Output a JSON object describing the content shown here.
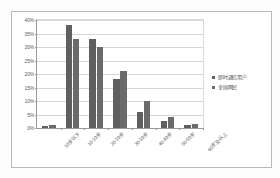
{
  "chart_data": {
    "type": "bar",
    "title": "",
    "subtitle": "",
    "xlabel": "",
    "ylabel": "",
    "ylim": [
      0,
      40
    ],
    "ytick_labels": [
      "0%",
      "5%",
      "10%",
      "15%",
      "20%",
      "25%",
      "30%",
      "35%",
      "40%"
    ],
    "ytick_values": [
      0,
      5,
      10,
      15,
      20,
      25,
      30,
      35,
      40
    ],
    "grid": true,
    "legend_position": "right",
    "categories": [
      "10岁以下",
      "10-19岁",
      "20-29岁",
      "30-39岁",
      "40-49岁",
      "50-59岁",
      "60岁及以上"
    ],
    "series": [
      {
        "name": "即时通信用户",
        "color": "#5f5f5f",
        "values": [
          0.8,
          38.0,
          33.0,
          18.0,
          6.0,
          2.5,
          1.0
        ]
      },
      {
        "name": "全国网民",
        "color": "#6a6a6a",
        "values": [
          1.3,
          33.0,
          30.0,
          21.0,
          10.0,
          4.0,
          1.5
        ]
      }
    ]
  },
  "legend": {
    "items": [
      {
        "label": "即时通信用户"
      },
      {
        "label": "全国网民"
      }
    ]
  }
}
